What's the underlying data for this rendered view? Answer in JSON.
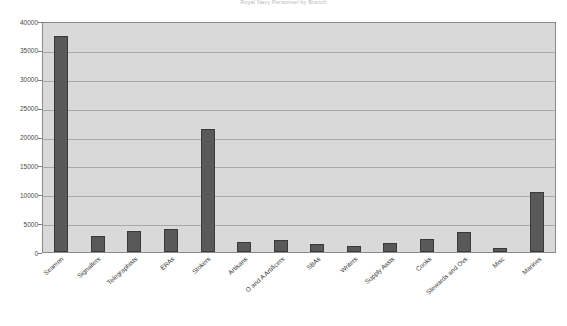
{
  "chart_data": {
    "type": "bar",
    "title": "Royal Navy Personnel by Branch",
    "xlabel": "",
    "ylabel": "",
    "ylim": [
      0,
      40000
    ],
    "ytick_step": 5000,
    "yticks": [
      0,
      5000,
      10000,
      15000,
      20000,
      25000,
      30000,
      35000,
      40000
    ],
    "ytick_labels": [
      "0",
      "5000",
      "10000",
      "15000",
      "20000",
      "25000",
      "30000",
      "35000",
      "40000"
    ],
    "grid": true,
    "legend": false,
    "bar_color": "#595959",
    "bar_border_color": "#3a3a3a",
    "plot_background": "#d9d9d9",
    "gridline_color": "#a9a9a9",
    "axis_color": "#8a8a8a",
    "categories": [
      "Seamen",
      "Signallers",
      "Telegraphists",
      "ERAs",
      "Stokers",
      "Artisans",
      "O and A Artificers",
      "SBAs",
      "Writers",
      "Supply Assts",
      "Cooks",
      "Stewards and Ovs",
      "Misc",
      "Marines"
    ],
    "values": [
      37400,
      2700,
      3600,
      3900,
      21300,
      1700,
      2100,
      1400,
      1000,
      1600,
      2200,
      3400,
      700,
      10400
    ]
  }
}
